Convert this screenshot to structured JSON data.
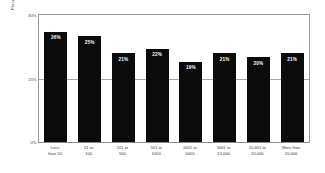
{
  "chart_data": {
    "type": "bar",
    "title": "",
    "subtitle": "",
    "xlabel": "",
    "ylabel": "Percent of project FTE dedicated to CM",
    "ylim": [
      0,
      30
    ],
    "yticks": [
      "0%",
      "15%",
      "30%"
    ],
    "ytick_values": [
      0,
      15,
      30
    ],
    "grid": true,
    "legend": "none",
    "bar_color": "#0b0b0b",
    "value_label_color": "#ffffff",
    "categories": [
      "Less\nthan 50",
      "51 to\n100",
      "101 to\n500",
      "501 to\n1000",
      "1001 to\n5000",
      "5001 to\n10,000",
      "10,001 to\n20,000",
      "More than\n20,000"
    ],
    "values": [
      26,
      25,
      21,
      22,
      19,
      21,
      20,
      21
    ],
    "value_labels": [
      "26%",
      "25%",
      "21%",
      "22%",
      "19%",
      "21%",
      "20%",
      "21%"
    ]
  }
}
